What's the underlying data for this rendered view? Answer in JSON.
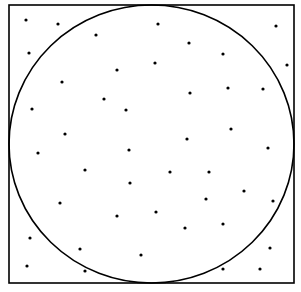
{
  "diagram": {
    "stroke_color": "#000000",
    "background_color": "#ffffff",
    "square": {
      "x": 9,
      "y": 5,
      "width": 285,
      "height": 278,
      "stroke_width": 1.6
    },
    "circle": {
      "cx": 151.5,
      "cy": 144,
      "rx": 142.5,
      "ry": 139,
      "stroke_width": 1.6
    },
    "dot_radius": 1.6,
    "points": [
      [
        26,
        20
      ],
      [
        58,
        24
      ],
      [
        158,
        24
      ],
      [
        276,
        26
      ],
      [
        96,
        35
      ],
      [
        189,
        43
      ],
      [
        29,
        53
      ],
      [
        223,
        54
      ],
      [
        155,
        63
      ],
      [
        287,
        65
      ],
      [
        117,
        70
      ],
      [
        62,
        82
      ],
      [
        228,
        88
      ],
      [
        263,
        89
      ],
      [
        190,
        93
      ],
      [
        104,
        99
      ],
      [
        32,
        109
      ],
      [
        126,
        110
      ],
      [
        231,
        129
      ],
      [
        65,
        134
      ],
      [
        187,
        139
      ],
      [
        268,
        148
      ],
      [
        129,
        150
      ],
      [
        38,
        153
      ],
      [
        170,
        172
      ],
      [
        209,
        172
      ],
      [
        85,
        170
      ],
      [
        130,
        183
      ],
      [
        244,
        191
      ],
      [
        206,
        199
      ],
      [
        273,
        201
      ],
      [
        60,
        203
      ],
      [
        156,
        212
      ],
      [
        117,
        216
      ],
      [
        223,
        224
      ],
      [
        185,
        228
      ],
      [
        30,
        238
      ],
      [
        270,
        248
      ],
      [
        80,
        249
      ],
      [
        141,
        255
      ],
      [
        27,
        266
      ],
      [
        85,
        271
      ],
      [
        223,
        269
      ],
      [
        260,
        269
      ]
    ]
  }
}
